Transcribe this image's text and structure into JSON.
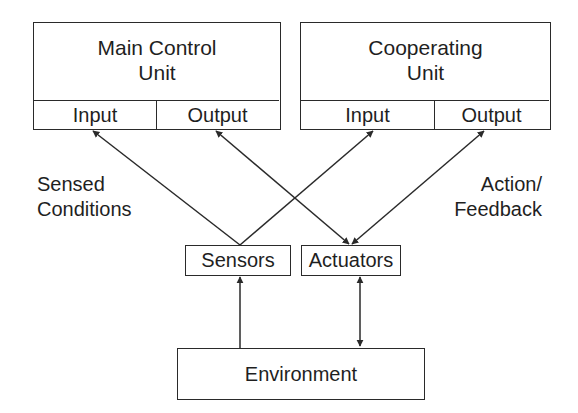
{
  "diagram": {
    "units": {
      "main": {
        "title_line1": "Main Control",
        "title_line2": "Unit",
        "input_label": "Input",
        "output_label": "Output"
      },
      "cooperating": {
        "title_line1": "Cooperating",
        "title_line2": "Unit",
        "input_label": "Input",
        "output_label": "Output"
      }
    },
    "sensors_label": "Sensors",
    "actuators_label": "Actuators",
    "environment_label": "Environment",
    "annotations": {
      "left_line1": "Sensed",
      "left_line2": "Conditions",
      "right_line1": "Action/",
      "right_line2": "Feedback"
    },
    "connections": [
      {
        "from": "Sensors",
        "to": "Main Control Unit Input",
        "direction": "one-way"
      },
      {
        "from": "Sensors",
        "to": "Cooperating Unit Input",
        "direction": "one-way"
      },
      {
        "from": "Main Control Unit Output",
        "to": "Actuators",
        "direction": "two-way"
      },
      {
        "from": "Cooperating Unit Output",
        "to": "Actuators",
        "direction": "two-way"
      },
      {
        "from": "Environment",
        "to": "Sensors",
        "direction": "one-way"
      },
      {
        "from": "Environment",
        "to": "Actuators",
        "direction": "two-way"
      }
    ],
    "colors": {
      "stroke": "#2a2a2a",
      "background": "#ffffff",
      "text": "#1f1f1f"
    }
  }
}
